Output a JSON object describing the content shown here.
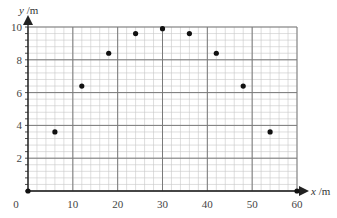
{
  "chart_data": {
    "type": "scatter",
    "title": "",
    "xlabel": "x /m",
    "ylabel": "y /m",
    "xlim": [
      0,
      60
    ],
    "ylim": [
      0,
      10
    ],
    "x_ticks": [
      0,
      10,
      20,
      30,
      40,
      50,
      60
    ],
    "y_ticks": [
      2,
      4,
      6,
      8,
      10
    ],
    "x_tick_labels": [
      "0",
      "10",
      "20",
      "30",
      "40",
      "50",
      "60"
    ],
    "y_tick_labels": [
      "2",
      "4",
      "6",
      "8",
      "10"
    ],
    "grid": {
      "on": true,
      "major_x_step": 10,
      "major_y_step": 2,
      "minor_x_step": 2,
      "minor_y_step": 0.4
    },
    "legend": null,
    "series": [
      {
        "name": "points",
        "marker": "filled-circle",
        "color": "#111111",
        "x": [
          0,
          6,
          12,
          18,
          24,
          30,
          36,
          42,
          48,
          54,
          60
        ],
        "y": [
          0,
          3.6,
          6.4,
          8.4,
          9.6,
          9.9,
          9.6,
          8.4,
          6.4,
          3.6,
          0
        ]
      }
    ]
  },
  "labels": {
    "x_axis_var": "x",
    "x_axis_unit": " /m",
    "y_axis_var": "y",
    "y_axis_unit": " /m"
  },
  "colors": {
    "minor_grid": "#c8c8c8",
    "major_grid": "#7a7a7a",
    "axis": "#222222",
    "point": "#111111"
  }
}
